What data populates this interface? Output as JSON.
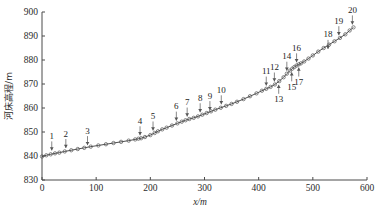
{
  "chart_data": {
    "type": "line",
    "title": "",
    "xlabel": "x/m",
    "ylabel": "河床高程/m",
    "xlim": [
      0,
      600
    ],
    "ylim": [
      830,
      900
    ],
    "xticks": [
      0,
      100,
      200,
      300,
      400,
      500,
      600
    ],
    "xtick_labels": [
      "0",
      "100",
      "200",
      "300",
      "400",
      "500",
      "600"
    ],
    "yticks": [
      830,
      840,
      850,
      860,
      870,
      880,
      890,
      900
    ],
    "ytick_labels": [
      "830",
      "840",
      "850",
      "860",
      "870",
      "880",
      "890",
      "900"
    ],
    "grid": false,
    "legend": null,
    "marker": "open-circle",
    "series": [
      {
        "name": "河床高程",
        "x": [
          0,
          8,
          16,
          24,
          32,
          42,
          54,
          66,
          78,
          90,
          104,
          118,
          132,
          146,
          160,
          172,
          178,
          183,
          190,
          200,
          208,
          214,
          222,
          230,
          240,
          250,
          258,
          265,
          272,
          280,
          288,
          296,
          304,
          312,
          320,
          330,
          340,
          350,
          360,
          372,
          384,
          396,
          406,
          414,
          422,
          430,
          438,
          446,
          452,
          458,
          462,
          466,
          470,
          474,
          478,
          484,
          492,
          500,
          510,
          520,
          530,
          540,
          550,
          560,
          568,
          575
        ],
        "y": [
          839.8,
          840.3,
          840.7,
          841.1,
          841.4,
          841.9,
          842.4,
          842.9,
          843.4,
          843.9,
          844.4,
          844.9,
          845.4,
          845.9,
          846.4,
          846.9,
          847.2,
          847.4,
          847.9,
          848.7,
          849.6,
          850.3,
          851.1,
          851.8,
          852.7,
          853.6,
          854.3,
          854.9,
          855.4,
          855.9,
          856.5,
          857.2,
          857.9,
          858.6,
          859.3,
          860.1,
          860.9,
          861.7,
          862.6,
          863.7,
          864.9,
          866.1,
          867.2,
          868.0,
          868.8,
          869.8,
          871.2,
          872.8,
          874.3,
          875.6,
          876.4,
          877.1,
          877.7,
          878.2,
          878.6,
          879.4,
          880.6,
          881.9,
          883.5,
          885.0,
          886.4,
          887.8,
          889.2,
          890.7,
          892.3,
          893.6
        ]
      }
    ],
    "annotations": [
      {
        "label": "1",
        "x": 18,
        "y": 841.0,
        "direction": "down"
      },
      {
        "label": "2",
        "x": 44,
        "y": 842.0,
        "direction": "down"
      },
      {
        "label": "3",
        "x": 84,
        "y": 843.2,
        "direction": "down"
      },
      {
        "label": "4",
        "x": 181,
        "y": 847.3,
        "direction": "down"
      },
      {
        "label": "5",
        "x": 205,
        "y": 849.3,
        "direction": "down"
      },
      {
        "label": "6",
        "x": 248,
        "y": 853.4,
        "direction": "down"
      },
      {
        "label": "7",
        "x": 268,
        "y": 855.1,
        "direction": "down"
      },
      {
        "label": "8",
        "x": 292,
        "y": 856.9,
        "direction": "down"
      },
      {
        "label": "9",
        "x": 310,
        "y": 857.8,
        "direction": "down"
      },
      {
        "label": "10",
        "x": 331,
        "y": 860.2,
        "direction": "down"
      },
      {
        "label": "11",
        "x": 414,
        "y": 868.0,
        "direction": "down"
      },
      {
        "label": "12",
        "x": 429,
        "y": 869.7,
        "direction": "down"
      },
      {
        "label": "13",
        "x": 437,
        "y": 871.0,
        "direction": "up"
      },
      {
        "label": "14",
        "x": 452,
        "y": 874.2,
        "direction": "down"
      },
      {
        "label": "15",
        "x": 461,
        "y": 876.2,
        "direction": "up"
      },
      {
        "label": "16",
        "x": 470,
        "y": 877.7,
        "direction": "down"
      },
      {
        "label": "17",
        "x": 474,
        "y": 878.2,
        "direction": "up"
      },
      {
        "label": "18",
        "x": 528,
        "y": 883.3,
        "direction": "down"
      },
      {
        "label": "19",
        "x": 548,
        "y": 889.0,
        "direction": "down"
      },
      {
        "label": "20",
        "x": 573,
        "y": 893.5,
        "direction": "down"
      }
    ]
  },
  "colors": {
    "axis": "#4a4a4a",
    "line": "#3b3b3b",
    "marker": "#555555",
    "annotation": "#555555",
    "background": "#ffffff"
  }
}
